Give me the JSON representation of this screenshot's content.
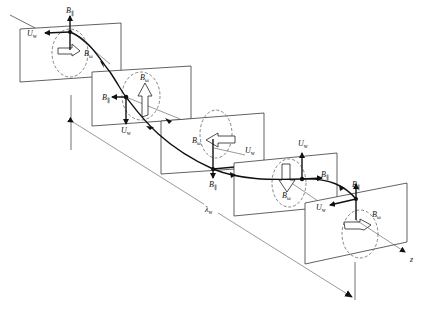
{
  "diagram": {
    "type": "helical-wiggler-field-and-velocity",
    "labels": {
      "b_perp": "B",
      "b_perp_sub": "⊥",
      "b_parallel": "B",
      "b_parallel_sub": "∥",
      "b_omega": "B",
      "b_omega_sub": "ω",
      "u_w": "U",
      "u_w_sub": "w",
      "lambda": "λ",
      "lambda_sub": "w",
      "z_axis": "z"
    },
    "planes": [
      {
        "id": 1,
        "labels": [
          "B∥ (up)",
          "U_w (left)",
          "B_ω (right arrow)"
        ]
      },
      {
        "id": 2,
        "labels": [
          "B_ω (up arrow)",
          "B∥ (left)",
          "U_w (down)"
        ]
      },
      {
        "id": 3,
        "labels": [
          "B_ω (left arrow)",
          "U_w (right)",
          "B∥ (down)"
        ]
      },
      {
        "id": 4,
        "labels": [
          "U_w (up)",
          "B∥ (right)",
          "B_ω (down arrow)"
        ]
      },
      {
        "id": 5,
        "labels": [
          "B∥ (up)",
          "U_w (left)",
          "B_ω (right arrow)"
        ]
      }
    ],
    "wavelength_label": "λ_w",
    "axis_label": "z"
  }
}
